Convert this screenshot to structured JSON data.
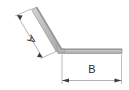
{
  "drawing": {
    "title": "bent-bar-dimension-diagram",
    "background_color": "#ffffff",
    "part": {
      "name": "bent-bar",
      "fill_color": "#b9b9b9",
      "stroke_color": "#9a9a9a",
      "description": "bar bent at an obtuse angle, horizontal right leg and upward-left inclined leg"
    },
    "dimensions": [
      {
        "id": "A",
        "label": "A",
        "label_text": "A",
        "orientation": "rotated",
        "rotation_degrees": 125,
        "applies_to": "inclined-leg",
        "line_color": "#8c8c8c",
        "arrow_color": "#444444"
      },
      {
        "id": "B",
        "label": "B",
        "label_text": "B",
        "orientation": "horizontal",
        "rotation_degrees": 0,
        "applies_to": "horizontal-leg",
        "line_color": "#8c8c8c",
        "arrow_color": "#444444"
      }
    ]
  }
}
